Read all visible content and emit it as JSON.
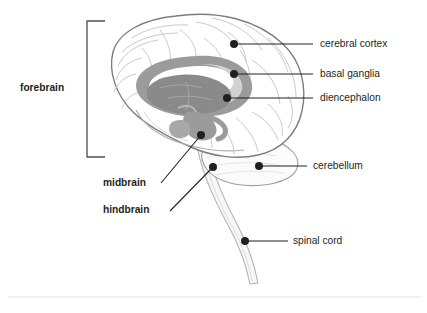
{
  "figure": {
    "background_color": "#ffffff"
  },
  "colors": {
    "outline": "#7d7d7d",
    "sulci": "#c9c9c9",
    "basal_ganglia_fill": "#9b9b9b",
    "diencephalon_fill": "#8a8a8a",
    "corpus_light_fill": "#d2d2d2",
    "brainstem_fill": "#f3f3f3",
    "leader_line": "#231f20",
    "dot": "#231f20",
    "bracket": "#4d4d4d",
    "divider_rule": "#e2e2e2",
    "text": "#231f20"
  },
  "bracket_labels": [
    {
      "id": "forebrain",
      "label": "forebrain",
      "bold": true,
      "x": 20,
      "y": 83,
      "bracket": {
        "x": 87,
        "top": 21,
        "bottom": 157,
        "arm": 18
      }
    }
  ],
  "leader_labels": [
    {
      "id": "cerebral-cortex",
      "label": "cerebral cortex",
      "bold": false,
      "align": "left",
      "text_x": 320,
      "text_y": 39,
      "dot": {
        "x": 234,
        "y": 44
      },
      "line_to": {
        "x": 313,
        "y": 44
      }
    },
    {
      "id": "basal-ganglia",
      "label": "basal ganglia",
      "bold": false,
      "align": "left",
      "text_x": 320,
      "text_y": 69,
      "dot": {
        "x": 234,
        "y": 74
      },
      "line_to": {
        "x": 313,
        "y": 74
      }
    },
    {
      "id": "diencephalon",
      "label": "diencephalon",
      "bold": false,
      "align": "left",
      "text_x": 320,
      "text_y": 93,
      "dot": {
        "x": 227,
        "y": 98
      },
      "line_to": {
        "x": 313,
        "y": 98
      }
    },
    {
      "id": "cerebellum",
      "label": "cerebellum",
      "bold": false,
      "align": "left",
      "text_x": 313,
      "text_y": 161,
      "dot": {
        "x": 259,
        "y": 166
      },
      "line_to": {
        "x": 307,
        "y": 166
      }
    },
    {
      "id": "spinal-cord",
      "label": "spinal cord",
      "bold": false,
      "align": "left",
      "text_x": 293,
      "text_y": 236,
      "dot": {
        "x": 245,
        "y": 241
      },
      "line_to": {
        "x": 288,
        "y": 241
      }
    },
    {
      "id": "midbrain",
      "label": "midbrain",
      "bold": true,
      "align": "right",
      "text_x": 103,
      "text_y": 178,
      "dot": {
        "x": 201,
        "y": 135
      },
      "line_to": {
        "x": 161,
        "y": 183
      }
    },
    {
      "id": "hindbrain",
      "label": "hindbrain",
      "bold": true,
      "align": "right",
      "text_x": 103,
      "text_y": 205,
      "dot": {
        "x": 213,
        "y": 167
      },
      "line_to": {
        "x": 170,
        "y": 211
      }
    }
  ],
  "divider": {
    "x1": 8,
    "x2": 420,
    "y": 297
  }
}
